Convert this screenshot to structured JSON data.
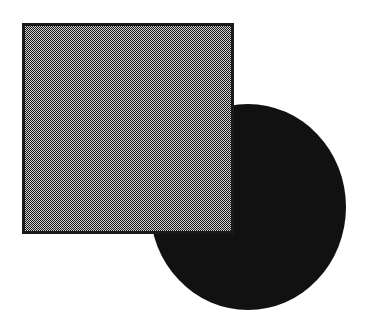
{
  "canvas": {
    "width": 370,
    "height": 335,
    "background": "#ffffff"
  },
  "shapes": [
    {
      "id": "circle",
      "type": "ellipse",
      "cx": 248,
      "cy": 207,
      "rx": 98,
      "ry": 103,
      "fill": "#111111",
      "z_order": 0
    },
    {
      "id": "square",
      "type": "rect",
      "x": 22,
      "y": 23,
      "width": 212,
      "height": 211,
      "fill_pattern": "checker-dither",
      "pattern_colors": [
        "#1a1a1a",
        "#cfcfcf"
      ],
      "stroke": "#1a1a1a",
      "stroke_width": 3,
      "z_order": 1
    }
  ]
}
